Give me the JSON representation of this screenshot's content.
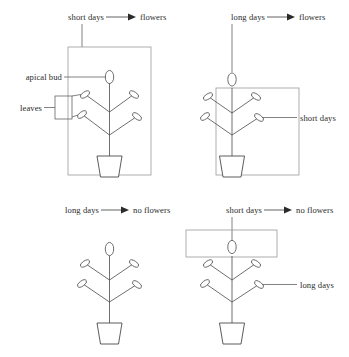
{
  "figure": {
    "plant_part_labels": {
      "apical_bud": "apical bud",
      "leaves": "leaves"
    },
    "panels": [
      {
        "id": "panel-top-left",
        "position": "top-left",
        "treatment_label": "short days",
        "result_label": "flowers",
        "arrow": "right-arrow",
        "enclosure": "whole-plant-box",
        "side_label": null,
        "part_labels": [
          "apical bud",
          "leaves"
        ]
      },
      {
        "id": "panel-top-right",
        "position": "top-right",
        "treatment_label": "long days",
        "result_label": "flowers",
        "arrow": "right-arrow",
        "enclosure": "body-box-excluding-apical-bud",
        "side_label": "short days",
        "part_labels": []
      },
      {
        "id": "panel-bottom-left",
        "position": "bottom-left",
        "treatment_label": "long days",
        "result_label": "no flowers",
        "arrow": "right-arrow",
        "enclosure": "none",
        "side_label": null,
        "part_labels": []
      },
      {
        "id": "panel-bottom-right",
        "position": "bottom-right",
        "treatment_label": "short days",
        "result_label": "no flowers",
        "arrow": "right-arrow",
        "enclosure": "apical-bud-only-box",
        "side_label": "long days",
        "part_labels": []
      }
    ],
    "colors": {
      "ink": "#2b2b2b",
      "plant_stroke": "#4a4a4a",
      "box_stroke": "#9a9a9a",
      "leader_stroke": "#5a5a5a",
      "background": "#ffffff"
    }
  }
}
